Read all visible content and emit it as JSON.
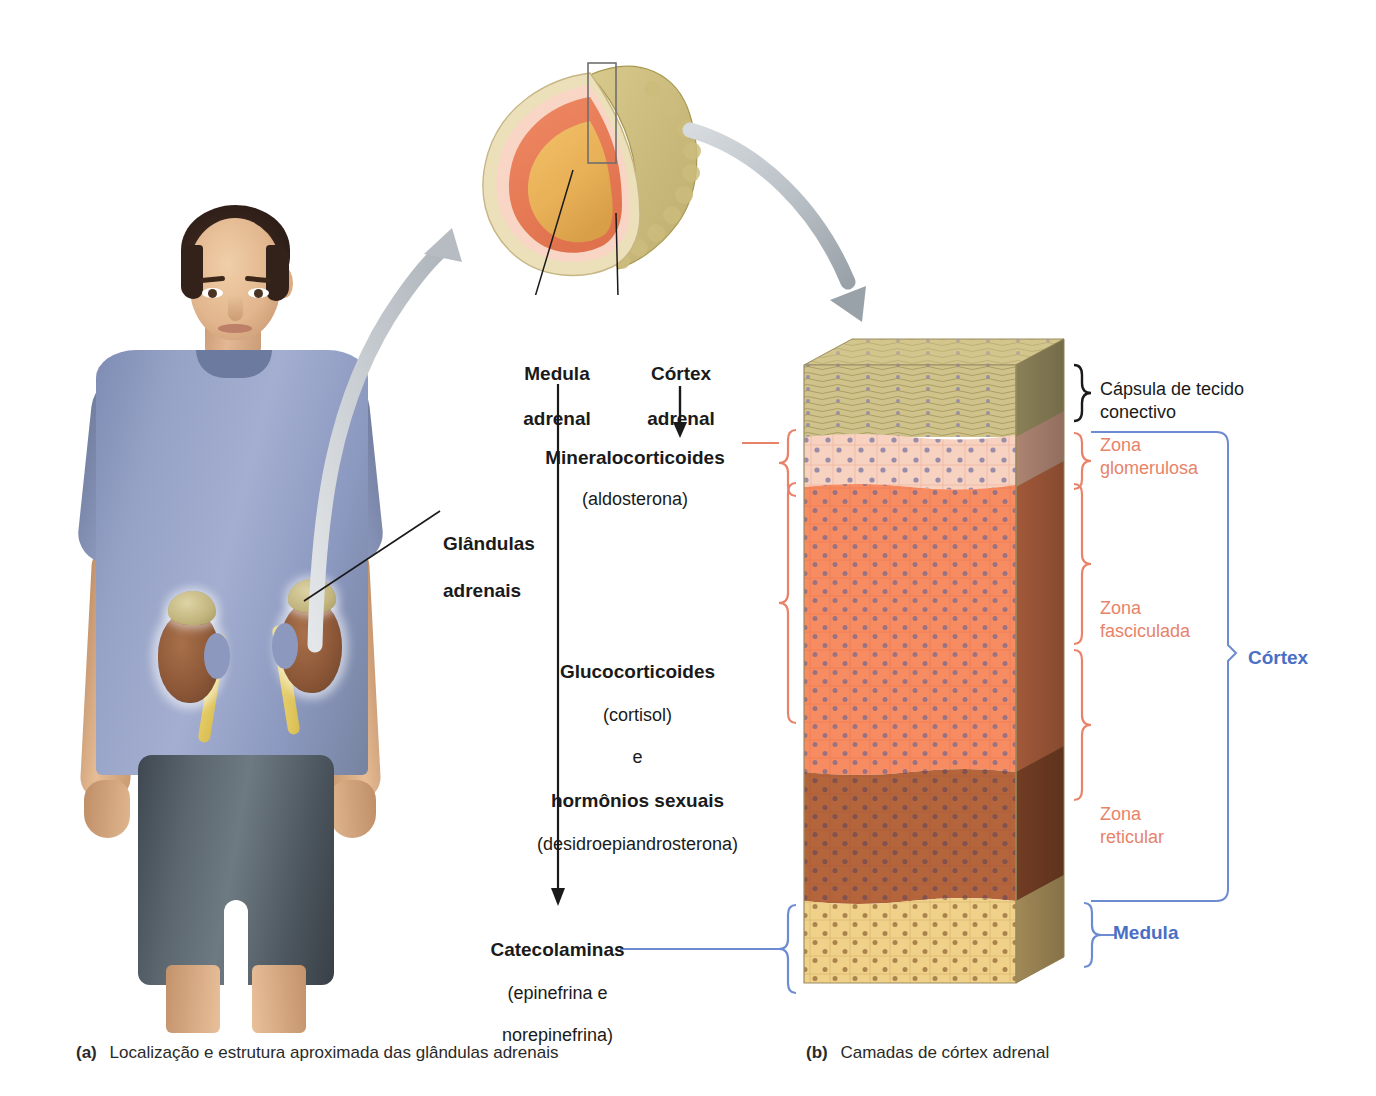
{
  "figure": {
    "captions": {
      "a_marker": "(a)",
      "a_text": "Localização e estrutura aproximada das glândulas adrenais",
      "b_marker": "(b)",
      "b_text": "Camadas de córtex adrenal"
    }
  },
  "panel_a": {
    "gland_label": {
      "line1": "Glândulas",
      "line2": "adrenais"
    }
  },
  "center": {
    "medulla_label": {
      "line1": "Medula",
      "line2": "adrenal"
    },
    "cortex_label": {
      "line1": "Córtex",
      "line2": "adrenal"
    },
    "hormones": [
      {
        "name": "mineralocorticoids",
        "bold": "Mineralocorticoides",
        "detail": "(aldosterona)"
      },
      {
        "name": "glucocorticoids-and-sex-hormones",
        "bold": "Glucocorticoides",
        "detail": "(cortisol)",
        "conjunction": "e",
        "bold2": "hormônios sexuais",
        "detail2": "(desidroepiandrosterona)"
      },
      {
        "name": "catecholamines",
        "bold": "Catecolaminas",
        "detail": "(epinefrina e",
        "detail2": "norepinefrina)"
      }
    ]
  },
  "panel_b": {
    "layers": [
      {
        "key": "capsule",
        "label": "Cápsula de tecido\nconectivo",
        "color": "#c9bd84",
        "label_color": "#1a1a1a"
      },
      {
        "key": "glomerulosa",
        "label": "Zona\nglomerulosa",
        "color": "#f7cdbb",
        "label_color": "#e8836a"
      },
      {
        "key": "fasciculata",
        "label": "Zona\nfasciculada",
        "color": "#f6885f",
        "label_color": "#e8836a"
      },
      {
        "key": "reticular",
        "label": "Zona\nreticular",
        "color": "#b5653c",
        "label_color": "#e8836a"
      },
      {
        "key": "medulla",
        "label": "Medula",
        "color": "#efcf86",
        "label_color": "#4a6fc4"
      }
    ],
    "group_labels": [
      {
        "key": "cortex",
        "label": "Córtex",
        "color": "#4a6fc4"
      },
      {
        "key": "medulla",
        "label": "Medula",
        "color": "#4a6fc4"
      }
    ]
  },
  "colors": {
    "salmon_brace": "#e8836a",
    "blue_brace": "#6d8bd0",
    "black_brace": "#1a1a1a",
    "gray_arrow": "#b6bcc2",
    "text": "#1a1a1a"
  }
}
